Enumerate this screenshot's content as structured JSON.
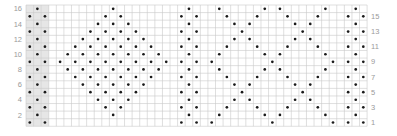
{
  "chart_data": {
    "type": "knitting-chart",
    "columns": 45,
    "rows": 16,
    "left_row_labels": [
      "16",
      "14",
      "12",
      "10",
      "8",
      "6",
      "4",
      "2"
    ],
    "right_row_labels": [
      "15",
      "13",
      "11",
      "9",
      "7",
      "5",
      "3",
      "1"
    ],
    "shaded_columns": [
      0,
      1,
      2
    ],
    "colors": {
      "grid": "#c9c9c9",
      "shade": "#e6e6e6",
      "dot": "#1a1a1a",
      "label": "#9a9a9a"
    },
    "symbol": "dot",
    "motifs": [
      {
        "name": "selvedge-left",
        "kind": "column-pair",
        "center_col": 1
      },
      {
        "name": "diamond",
        "kind": "filled-diamond",
        "center_col": 11,
        "top_row": 16,
        "widest_row": 9,
        "bottom_row": 2
      },
      {
        "name": "column-block-middle",
        "kind": "column-pair",
        "center_col": 21
      },
      {
        "name": "zigzag-lattice",
        "kind": "zigzag",
        "lines": [
          {
            "row1_col": 24,
            "dir": 1
          },
          {
            "row1_col": 32,
            "dir": -1
          },
          {
            "row1_col": 32,
            "dir": 1
          },
          {
            "row1_col": 40,
            "dir": -1
          }
        ],
        "amplitude": 4,
        "period_rows": 8
      },
      {
        "name": "column-block-right",
        "kind": "column-pair",
        "center_col": 43
      }
    ]
  }
}
